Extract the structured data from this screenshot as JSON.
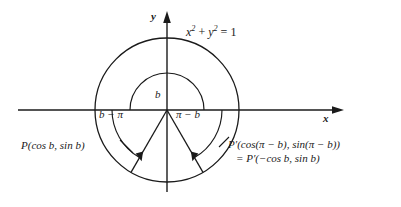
{
  "figure": {
    "type": "unit-circle-diagram",
    "background_color": "#ffffff",
    "stroke_color": "#1a1a1a",
    "axes": {
      "x_label": "x",
      "y_label": "y",
      "origin": [
        167,
        110
      ]
    },
    "circle_equation": "x² + y² = 1",
    "circle_equation_parts": {
      "x": "x",
      "x_exp": "2",
      "plus": " + ",
      "y": "y",
      "y_exp": "2",
      "equals": " = ",
      "one": "1"
    },
    "angles": [
      {
        "name": "angle-b",
        "label": "b",
        "value_deg": 180
      },
      {
        "name": "angle-b-pi",
        "label": "b − π",
        "value_deg": -120
      },
      {
        "name": "angle-pi-b",
        "label": "π − b",
        "value_deg": -60
      }
    ],
    "points": [
      {
        "name": "point-p",
        "label": "P(cos b, sin b)"
      },
      {
        "name": "point-p-prime",
        "label": "P′(cos(π − b), sin(π − b))"
      },
      {
        "name": "point-p-prime-alt",
        "label": "= P′(−cos b, sin b)"
      }
    ],
    "geometry": {
      "outer_circle_radius": 72,
      "inner_arc_radius": 37,
      "ray_left_angle_deg": -120,
      "ray_right_angle_deg": -60
    }
  }
}
